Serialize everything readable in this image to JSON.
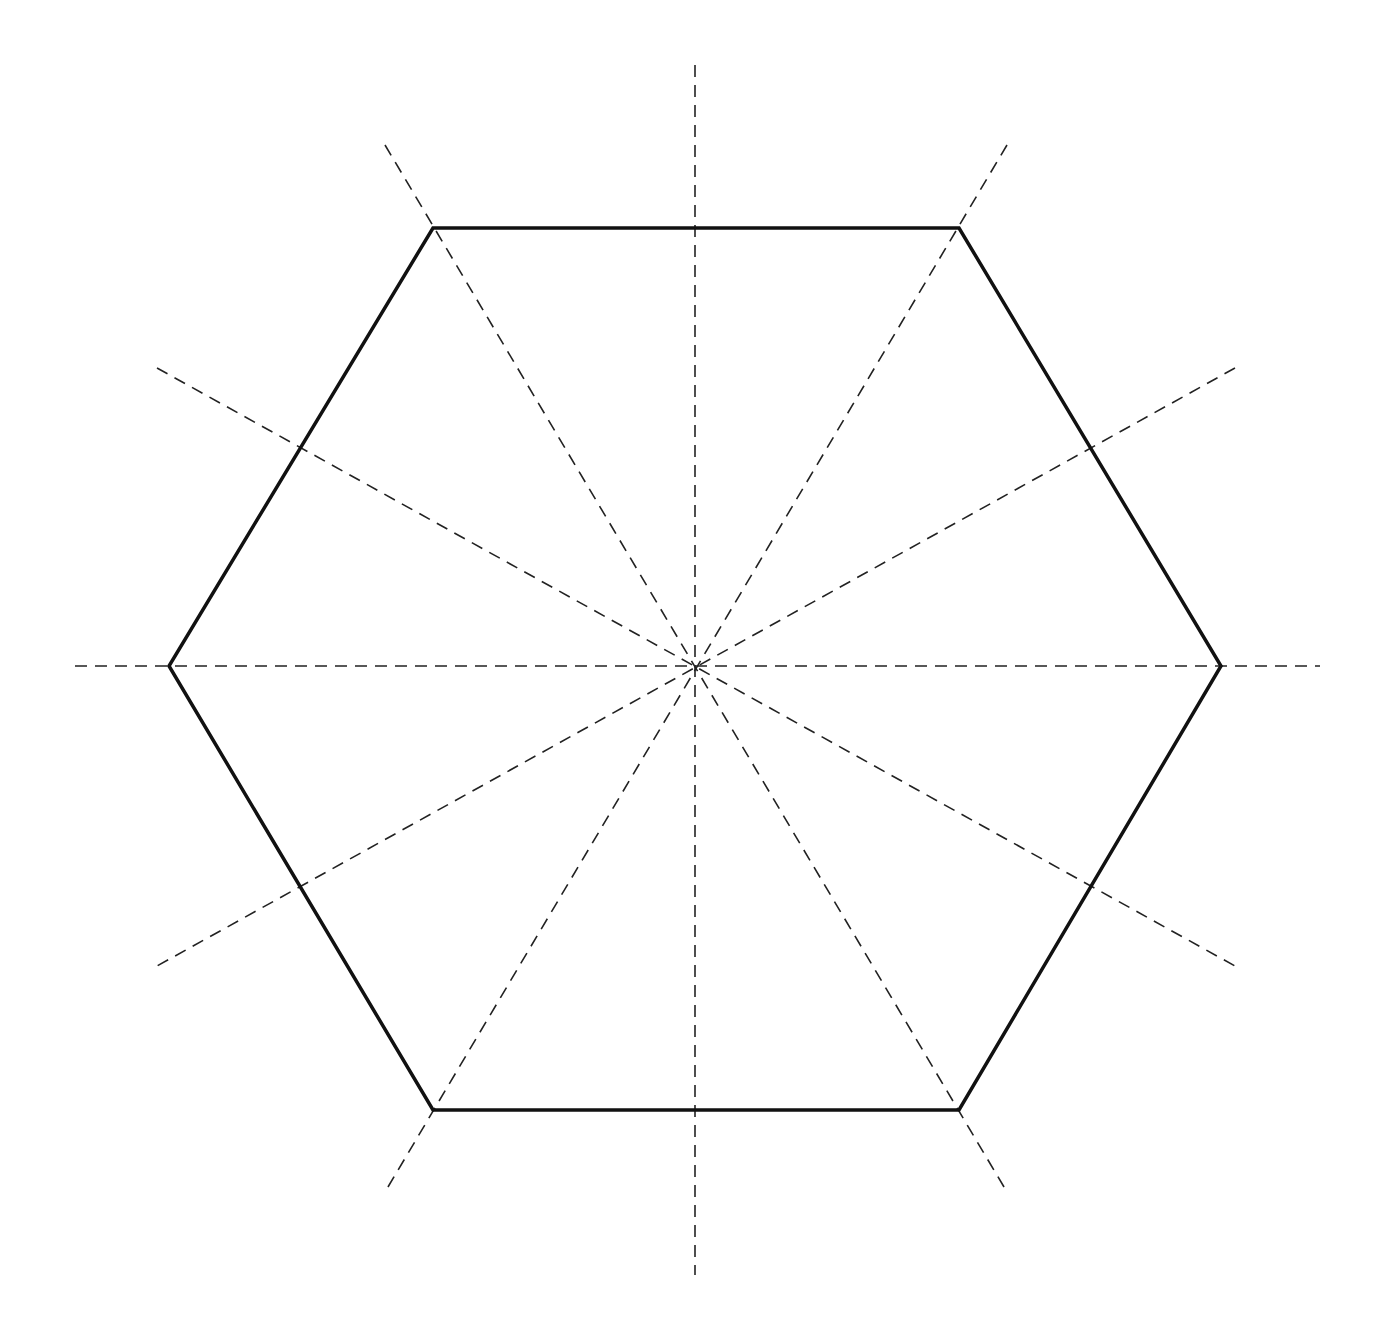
{
  "diagram": {
    "shape": "regular-hexagon",
    "center": [
      695,
      666
    ],
    "circumradius": 526,
    "vertices": [
      [
        433,
        228
      ],
      [
        959,
        228
      ],
      [
        1221,
        666
      ],
      [
        959,
        1110
      ],
      [
        433,
        1110
      ],
      [
        169,
        666
      ]
    ],
    "outline_color": "#111111",
    "outline_width": 3.5,
    "symmetry_line_count": 6,
    "symmetry_lines": [
      {
        "type": "vertex-to-vertex",
        "from": [
          75,
          666
        ],
        "to": [
          1320,
          666
        ]
      },
      {
        "type": "vertex-to-vertex",
        "from": [
          385,
          145
        ],
        "to": [
          1007,
          1192
        ]
      },
      {
        "type": "vertex-to-vertex",
        "from": [
          1007,
          145
        ],
        "to": [
          385,
          1192
        ]
      },
      {
        "type": "edge-midpoint",
        "from": [
          695,
          65
        ],
        "to": [
          695,
          1275
        ]
      },
      {
        "type": "edge-midpoint",
        "from": [
          157,
          368
        ],
        "to": [
          1235,
          966
        ]
      },
      {
        "type": "edge-midpoint",
        "from": [
          1235,
          368
        ],
        "to": [
          157,
          966
        ]
      }
    ],
    "dash_color": "#222222",
    "dash_width": 1.6,
    "dash_pattern": "12,8",
    "background": "#ffffff"
  }
}
